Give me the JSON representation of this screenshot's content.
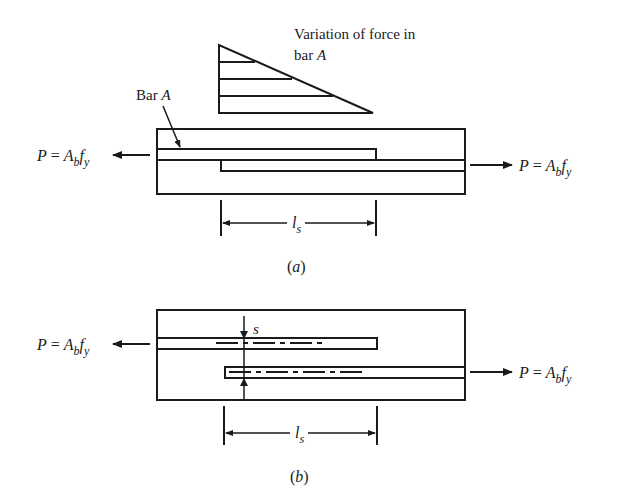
{
  "figure": {
    "panel_a": {
      "caption_open": "(",
      "caption_letter": "a",
      "caption_close": ")",
      "force_diagram_label_line1": "Variation of force in",
      "force_diagram_label_line2_prefix": "bar ",
      "force_diagram_label_line2_italic": "A",
      "bar_label_prefix": "Bar ",
      "bar_label_italic": "A",
      "left_force": {
        "P": "P",
        "eq": " = ",
        "A": "A",
        "sub_b": "b",
        "f": "f",
        "sub_y": "y"
      },
      "right_force": {
        "P": "P",
        "eq": " = ",
        "A": "A",
        "sub_b": "b",
        "f": "f",
        "sub_y": "y"
      },
      "splice_length": {
        "l": "l",
        "sub": "s"
      }
    },
    "panel_b": {
      "caption_open": "(",
      "caption_letter": "b",
      "caption_close": ")",
      "spacing_label": "s",
      "left_force": {
        "P": "P",
        "eq": " = ",
        "A": "A",
        "sub_b": "b",
        "f": "f",
        "sub_y": "y"
      },
      "right_force": {
        "P": "P",
        "eq": " = ",
        "A": "A",
        "sub_b": "b",
        "f": "f",
        "sub_y": "y"
      },
      "splice_length": {
        "l": "l",
        "sub": "s"
      }
    },
    "colors": {
      "ink": "#1a1a1a",
      "background": "#ffffff"
    }
  }
}
